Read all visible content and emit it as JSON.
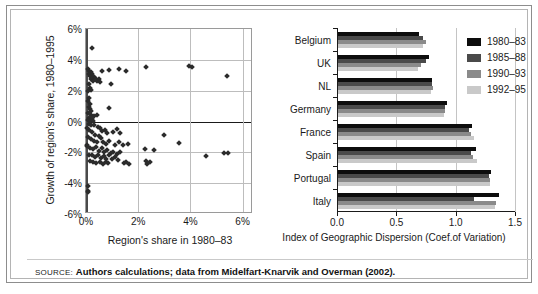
{
  "figure": {
    "source_label": "SOURCE:",
    "source_text": "Authors calculations; data from Midelfart-Knarvik and Overman (2002)."
  },
  "legend": {
    "position": "top-right-of-bar-chart",
    "entries": [
      {
        "label": "1980–83",
        "color": "#0d0d0d"
      },
      {
        "label": "1985–88",
        "color": "#4a4a4a"
      },
      {
        "label": "1990–93",
        "color": "#8a8a8a"
      },
      {
        "label": "1992–95",
        "color": "#c9c9c9"
      }
    ]
  },
  "chart_data": [
    {
      "id": "scatter",
      "type": "scatter",
      "title": "",
      "xlabel": "Region's share in 1980–83",
      "ylabel": "Growth of region's share, 1980–1995",
      "xlim": [
        0,
        6.4
      ],
      "ylim": [
        -6,
        6
      ],
      "xticks": [
        0,
        2,
        4,
        6
      ],
      "xticklabels": [
        "0%",
        "2%",
        "4%",
        "6%"
      ],
      "yticks": [
        -6,
        -4,
        -2,
        0,
        2,
        4,
        6
      ],
      "yticklabels": [
        "-6%",
        "-4%",
        "-2%",
        "0%",
        "2%",
        "4%",
        "6%"
      ],
      "grid": true,
      "marker": "diamond",
      "marker_color": "#2b2b2b",
      "points": [
        [
          0.22,
          4.8
        ],
        [
          0.08,
          3.4
        ],
        [
          0.12,
          3.3
        ],
        [
          0.18,
          3.2
        ],
        [
          0.1,
          3.05
        ],
        [
          0.16,
          2.95
        ],
        [
          0.24,
          3.1
        ],
        [
          0.3,
          2.9
        ],
        [
          0.2,
          2.75
        ],
        [
          0.28,
          2.6
        ],
        [
          0.36,
          2.8
        ],
        [
          0.42,
          2.65
        ],
        [
          0.5,
          2.75
        ],
        [
          0.62,
          3.25
        ],
        [
          0.55,
          2.55
        ],
        [
          0.1,
          2.45
        ],
        [
          0.14,
          2.2
        ],
        [
          0.2,
          2.05
        ],
        [
          0.08,
          1.95
        ],
        [
          0.9,
          3.35
        ],
        [
          1.25,
          3.4
        ],
        [
          1.55,
          3.25
        ],
        [
          2.3,
          3.55
        ],
        [
          3.95,
          3.6
        ],
        [
          4.05,
          3.55
        ],
        [
          5.4,
          2.95
        ],
        [
          0.95,
          2.45
        ],
        [
          0.12,
          1.55
        ],
        [
          0.09,
          1.3
        ],
        [
          0.16,
          1.15
        ],
        [
          0.1,
          0.95
        ],
        [
          0.14,
          0.8
        ],
        [
          0.2,
          0.7
        ],
        [
          0.08,
          0.55
        ],
        [
          0.18,
          0.45
        ],
        [
          0.3,
          0.35
        ],
        [
          0.42,
          0.45
        ],
        [
          0.12,
          0.25
        ],
        [
          0.22,
          0.15
        ],
        [
          0.06,
          0.08
        ],
        [
          0.16,
          0.02
        ],
        [
          0.28,
          0.05
        ],
        [
          0.9,
          0.85
        ],
        [
          0.1,
          -0.15
        ],
        [
          0.2,
          -0.25
        ],
        [
          0.32,
          -0.2
        ],
        [
          0.45,
          -0.35
        ],
        [
          0.55,
          -0.45
        ],
        [
          0.6,
          -0.6
        ],
        [
          0.72,
          -0.55
        ],
        [
          0.8,
          -0.75
        ],
        [
          0.12,
          -0.55
        ],
        [
          0.24,
          -0.7
        ],
        [
          0.35,
          -0.85
        ],
        [
          0.48,
          -0.95
        ],
        [
          1.05,
          -0.65
        ],
        [
          1.2,
          -0.5
        ],
        [
          1.3,
          -0.75
        ],
        [
          0.08,
          -1.0
        ],
        [
          0.18,
          -1.15
        ],
        [
          0.3,
          -1.25
        ],
        [
          0.44,
          -1.35
        ],
        [
          0.58,
          -1.1
        ],
        [
          0.66,
          -1.3
        ],
        [
          0.78,
          -1.45
        ],
        [
          0.9,
          -1.25
        ],
        [
          1.1,
          -1.5
        ],
        [
          1.25,
          -1.3
        ],
        [
          1.4,
          -1.55
        ],
        [
          1.6,
          -1.45
        ],
        [
          0.05,
          -1.55
        ],
        [
          0.14,
          -1.7
        ],
        [
          0.26,
          -1.8
        ],
        [
          0.38,
          -1.65
        ],
        [
          0.5,
          -1.9
        ],
        [
          0.62,
          -1.75
        ],
        [
          0.7,
          -2.0
        ],
        [
          0.82,
          -1.85
        ],
        [
          0.94,
          -2.05
        ],
        [
          1.05,
          -1.95
        ],
        [
          1.18,
          -2.1
        ],
        [
          1.3,
          -1.95
        ],
        [
          0.1,
          -2.15
        ],
        [
          0.22,
          -2.2
        ],
        [
          0.34,
          -2.3
        ],
        [
          0.46,
          -2.15
        ],
        [
          0.56,
          -2.35
        ],
        [
          0.68,
          -2.25
        ],
        [
          0.78,
          -2.4
        ],
        [
          0.88,
          -2.2
        ],
        [
          0.98,
          -2.45
        ],
        [
          1.12,
          -2.3
        ],
        [
          1.24,
          -2.5
        ],
        [
          0.15,
          -2.55
        ],
        [
          0.28,
          -2.65
        ],
        [
          0.4,
          -2.7
        ],
        [
          0.52,
          -2.6
        ],
        [
          0.64,
          -2.75
        ],
        [
          0.76,
          -2.6
        ],
        [
          0.86,
          -2.7
        ],
        [
          1.45,
          -2.7
        ],
        [
          1.55,
          -2.6
        ],
        [
          1.65,
          -2.75
        ],
        [
          2.3,
          -2.55
        ],
        [
          2.35,
          -2.75
        ],
        [
          2.45,
          -2.6
        ],
        [
          2.25,
          -1.8
        ],
        [
          2.6,
          -1.85
        ],
        [
          3.0,
          -0.85
        ],
        [
          3.55,
          -1.4
        ],
        [
          4.6,
          -2.25
        ],
        [
          5.3,
          -2.05
        ],
        [
          5.45,
          -2.05
        ],
        [
          0.06,
          -4.2
        ],
        [
          0.07,
          -4.5
        ],
        [
          0.09,
          -4.6
        ],
        [
          0.05,
          -1.6
        ],
        [
          0.05,
          -0.4
        ]
      ]
    },
    {
      "id": "bar",
      "type": "bar",
      "orientation": "horizontal",
      "title": "",
      "xlabel": "Index of Geographic Dispersion (Coef.of Variation)",
      "ylabel": "",
      "xlim": [
        0,
        1.5
      ],
      "xticks": [
        0.0,
        0.5,
        1.0,
        1.5
      ],
      "xticklabels": [
        "0.0",
        "0.5",
        "1.0",
        "1.5"
      ],
      "grid": true,
      "categories": [
        "Belgium",
        "UK",
        "NL",
        "Germany",
        "France",
        "Spain",
        "Portugal",
        "Italy"
      ],
      "series": [
        {
          "name": "1980–83",
          "color": "#0d0d0d",
          "values": [
            0.68,
            0.77,
            0.79,
            0.92,
            1.13,
            1.16,
            1.29,
            1.36
          ]
        },
        {
          "name": "1985–88",
          "color": "#4a4a4a",
          "values": [
            0.72,
            0.74,
            0.79,
            0.9,
            1.1,
            1.12,
            1.27,
            1.15
          ]
        },
        {
          "name": "1990–93",
          "color": "#8a8a8a",
          "values": [
            0.74,
            0.7,
            0.8,
            0.9,
            1.12,
            1.14,
            1.28,
            1.33
          ]
        },
        {
          "name": "1992–95",
          "color": "#c9c9c9",
          "values": [
            0.72,
            0.67,
            0.78,
            0.89,
            1.15,
            1.17,
            1.28,
            1.32
          ]
        }
      ]
    }
  ]
}
